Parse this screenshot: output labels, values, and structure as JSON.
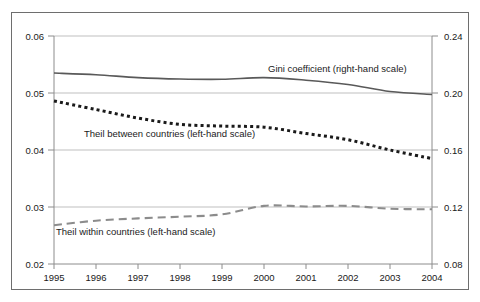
{
  "chart_data": {
    "type": "line",
    "title": "",
    "subtitle": "",
    "xlabel": "",
    "ylabel": "",
    "grid": true,
    "legend_position": "inline-annotations",
    "x": [
      1995,
      1996,
      1997,
      1998,
      1999,
      2000,
      2001,
      2002,
      2003,
      2004
    ],
    "categories": [
      "1995",
      "1996",
      "1997",
      "1998",
      "1999",
      "2000",
      "2001",
      "2002",
      "2003",
      "2004"
    ],
    "left_axis": {
      "label": "",
      "ylim": [
        0.02,
        0.06
      ],
      "ticks": [
        0.02,
        0.03,
        0.04,
        0.05,
        0.06
      ],
      "tick_labels": [
        "0.02",
        "0.03",
        "0.04",
        "0.05",
        "0.06"
      ]
    },
    "right_axis": {
      "label": "",
      "ylim": [
        0.08,
        0.24
      ],
      "ticks": [
        0.08,
        0.12,
        0.16,
        0.2,
        0.24
      ],
      "tick_labels": [
        "0.08",
        "0.12",
        "0.16",
        "0.20",
        "0.24"
      ]
    },
    "series": [
      {
        "name": "Gini coefficient (right-hand scale)",
        "axis": "right",
        "style": "solid",
        "color": "#595959",
        "values": [
          0.214,
          0.2128,
          0.2108,
          0.2098,
          0.2096,
          0.2108,
          0.209,
          0.206,
          0.201,
          0.199
        ]
      },
      {
        "name": "Theil between countries (left-hand scale)",
        "axis": "left",
        "style": "dotted",
        "color": "#1a1a1a",
        "values": [
          0.0486,
          0.0471,
          0.0456,
          0.0445,
          0.0442,
          0.044,
          0.0429,
          0.0418,
          0.04,
          0.0385
        ]
      },
      {
        "name": "Theil within countries (left-hand scale)",
        "axis": "left",
        "style": "dashed",
        "color": "#8c8c8c",
        "values": [
          0.0268,
          0.0276,
          0.028,
          0.0283,
          0.0287,
          0.0302,
          0.0301,
          0.0302,
          0.0297,
          0.0296
        ]
      }
    ],
    "annotations": [
      {
        "text": "Gini coefficient (right-hand scale)",
        "x_px": 268,
        "y_px": 72
      },
      {
        "text": "Theil between countries (left-hand scale)",
        "x_px": 84,
        "y_px": 137
      },
      {
        "text": "Theil within countries (left-hand scale)",
        "x_px": 56,
        "y_px": 235
      }
    ]
  },
  "colors": {
    "frame": "#6e6e6e",
    "axis": "#8c8c8c",
    "gridline": "#bfbfbf",
    "gini": "#595959",
    "theil_between": "#1a1a1a",
    "theil_within": "#8c8c8c",
    "text": "#1a1a1a",
    "background": "#ffffff"
  }
}
